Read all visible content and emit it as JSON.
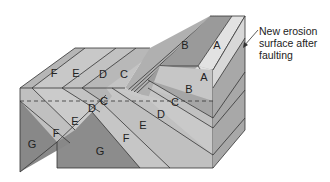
{
  "diagram": {
    "type": "block diagram",
    "colors": {
      "A": "#e4e4e4",
      "B": "#9a9a9a",
      "C": "#b4b4b4",
      "D": "#c2c2c2",
      "E": "#cacaca",
      "F": "#bdbdbd",
      "G": "#8c8c8c",
      "side": "#a8a8a8",
      "outline": "#333333"
    },
    "annotation": {
      "line1": "New erosion",
      "line2": "surface after",
      "line3": "faulting"
    },
    "layers": {
      "top_left": [
        "F",
        "E",
        "D",
        "C"
      ],
      "top_upthrown": [
        "B",
        "A"
      ],
      "front_upthrown": [
        "A",
        "B"
      ],
      "front_left": [
        "G",
        "F",
        "E",
        "D",
        "C"
      ],
      "front_right": [
        "G",
        "F",
        "E",
        "D",
        "C"
      ]
    },
    "labels": {
      "top_F": "F",
      "top_E": "E",
      "top_D": "D",
      "top_C": "C",
      "up_B": "B",
      "up_A": "A",
      "front_A": "A",
      "front_B": "B",
      "left_G": "G",
      "left_F": "F",
      "left_E": "E",
      "left_D": "D",
      "left_C": "C",
      "right_G": "G",
      "right_F": "F",
      "right_E": "E",
      "right_D": "D",
      "right_C": "C"
    }
  }
}
